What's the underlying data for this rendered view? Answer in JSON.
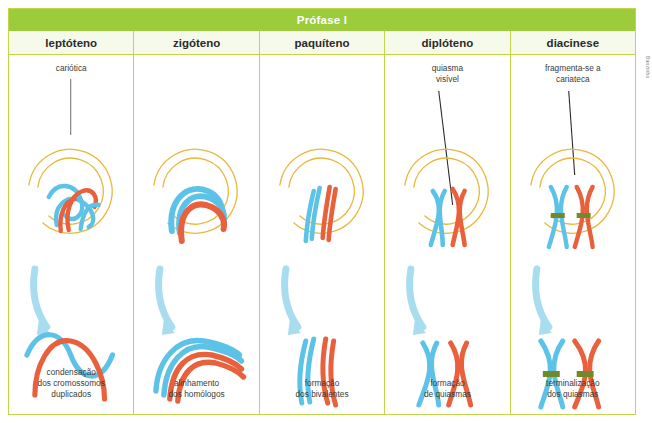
{
  "figure": {
    "title": "Prófase I",
    "credit": "Banzinho",
    "accent_green": "#9ccb3b",
    "border_green": "#c3d64a",
    "nucleus_outline": "#e8b83a",
    "chromosome_blue": "#5cc2e8",
    "chromosome_red": "#e8603c",
    "centromere_green": "#6f8a2a",
    "arrow_blue": "#a8ddef"
  },
  "stages": [
    {
      "name": "leptóteno",
      "callout": [
        "cariótica"
      ],
      "caption": [
        "condensação",
        "dos cromossomos",
        "duplicados"
      ]
    },
    {
      "name": "zigóteno",
      "callout": [],
      "caption": [
        "alinhamento",
        "dos homólogos"
      ]
    },
    {
      "name": "paquíteno",
      "callout": [],
      "caption": [
        "formação",
        "dos bivalentes"
      ]
    },
    {
      "name": "diplóteno",
      "callout": [
        "quiasma",
        "visível"
      ],
      "caption": [
        "formação",
        "de quiasmas"
      ]
    },
    {
      "name": "diacinese",
      "callout": [
        "fragmenta-se a",
        "cariateca"
      ],
      "caption": [
        "terminalização",
        "dos quiasmas"
      ]
    }
  ]
}
